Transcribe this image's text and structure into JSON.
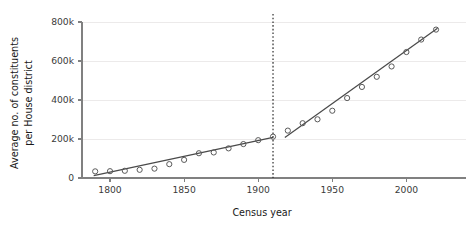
{
  "chart_data": {
    "type": "scatter",
    "title": "",
    "xlabel": "Census year",
    "ylabel": "Average no. of constituents per House district",
    "ylabel_line1": "Average no. of constituents",
    "ylabel_line2": "per House district",
    "xlim": [
      1786,
      2026
    ],
    "ylim": [
      0,
      820000
    ],
    "xticks": [
      1800,
      1850,
      1900,
      1950,
      2000
    ],
    "xtick_labels": [
      "1800",
      "1850",
      "1900",
      "1950",
      "2000"
    ],
    "yticks": [
      0,
      200000,
      400000,
      600000,
      800000
    ],
    "ytick_labels": [
      "0",
      "200k",
      "400k",
      "600k",
      "800k"
    ],
    "grid": "horizontal",
    "legend": "none",
    "marker_style": "open-circle",
    "annotations": [
      {
        "name": "apportionment-break",
        "type": "vertical-dotted-line",
        "x": 1910,
        "label": ""
      }
    ],
    "x": [
      1790,
      1800,
      1810,
      1820,
      1830,
      1840,
      1850,
      1860,
      1870,
      1880,
      1890,
      1900,
      1910,
      1920,
      1930,
      1940,
      1950,
      1960,
      1970,
      1980,
      1990,
      2000,
      2010,
      2020
    ],
    "y": [
      34000,
      35000,
      37000,
      42000,
      48000,
      71000,
      93000,
      127000,
      131000,
      152000,
      174000,
      194000,
      212000,
      243000,
      281000,
      301000,
      345000,
      410000,
      467000,
      519000,
      572000,
      646000,
      710000,
      761000
    ],
    "series": [
      {
        "name": "Average constituents per district",
        "marker": "open-circle",
        "x": [
          1790,
          1800,
          1810,
          1820,
          1830,
          1840,
          1850,
          1860,
          1870,
          1880,
          1890,
          1900,
          1910,
          1920,
          1930,
          1940,
          1950,
          1960,
          1970,
          1980,
          1990,
          2000,
          2010,
          2020
        ],
        "values": [
          34000,
          35000,
          37000,
          42000,
          48000,
          71000,
          93000,
          127000,
          131000,
          152000,
          174000,
          194000,
          212000,
          243000,
          281000,
          301000,
          345000,
          410000,
          467000,
          519000,
          572000,
          646000,
          710000,
          761000
        ]
      }
    ],
    "fits": [
      {
        "name": "pre-1910-trend",
        "type": "line",
        "x_start": 1789,
        "y_start": 12000,
        "x_end": 1910,
        "y_end": 208000
      },
      {
        "name": "post-1910-trend",
        "type": "line",
        "x_start": 1918,
        "y_start": 208000,
        "x_end": 2021,
        "y_end": 768000
      }
    ]
  },
  "colors": {
    "marker_stroke": "#5a5a5a",
    "fit_line": "#4a4a4a",
    "gridline": "#eceaea",
    "axis": "#808080",
    "break_line": "#2b2b2b",
    "text": "#1a1a1a",
    "background": "#ffffff"
  }
}
